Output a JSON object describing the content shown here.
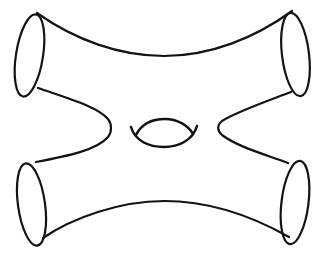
{
  "figure": {
    "type": "topology-line-drawing",
    "background_color": "#ffffff",
    "stroke_color": "#131313",
    "default_stroke_width": 2.2,
    "canvas": {
      "width": 325,
      "height": 258
    },
    "ellipses": [
      {
        "name": "boundary-circle-top-left",
        "cx": 29.5,
        "cy": 55.5,
        "rx": 13.5,
        "ry": 41.5,
        "rotate": 9
      },
      {
        "name": "boundary-circle-top-right",
        "cx": 295.5,
        "cy": 54.5,
        "rx": 13.5,
        "ry": 42,
        "rotate": -7
      },
      {
        "name": "boundary-circle-bottom-left",
        "cx": 31.5,
        "cy": 204.5,
        "rx": 13.5,
        "ry": 41.5,
        "rotate": -8
      },
      {
        "name": "boundary-circle-bottom-right",
        "cx": 295,
        "cy": 202.5,
        "rx": 13.5,
        "ry": 42,
        "rotate": 7
      }
    ],
    "paths": [
      {
        "name": "surface-edge-top",
        "d": "M 37,13 C 75,40 120,56 164,56 C 210,56 255,38 292,11",
        "stroke_width": 2.2
      },
      {
        "name": "surface-edge-bottom",
        "d": "M 43,238 C 72,218 120,201 164,201 C 208,201 252,216 289,237",
        "stroke_width": 2.2
      },
      {
        "name": "surface-edge-left-notch",
        "d": "M 38,88 C 70,99 98,107 108,119 C 112,124 112,132 108,137 C 97,150 68,156 36,162",
        "stroke_width": 2.2
      },
      {
        "name": "surface-edge-right-notch",
        "d": "M 291,92 C 262,103 236,112 222,121 C 217,125 217,131 222,135 C 238,147 264,154 288,163",
        "stroke_width": 2.2
      },
      {
        "name": "genus-hole-lower-arc",
        "d": "M 131,127 C 135,141 149,147 164,147 C 179,147 193,140 197,126",
        "stroke_width": 2.5
      },
      {
        "name": "genus-hole-upper-arc",
        "d": "M 136,135 C 142,123 153,119 165,119 C 177,119 188,125 193,134",
        "stroke_width": 2.5
      }
    ]
  }
}
